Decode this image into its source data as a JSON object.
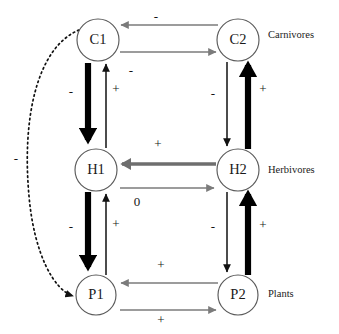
{
  "diagram": {
    "background_color": "#ffffff",
    "nodes": [
      {
        "id": "C1",
        "label": "C1",
        "cx": 98,
        "cy": 40,
        "r": 21
      },
      {
        "id": "C2",
        "label": "C2",
        "cx": 238,
        "cy": 40,
        "r": 21
      },
      {
        "id": "H1",
        "label": "H1",
        "cx": 96,
        "cy": 170,
        "r": 21
      },
      {
        "id": "H2",
        "label": "H2",
        "cx": 238,
        "cy": 170,
        "r": 21
      },
      {
        "id": "P1",
        "label": "P1",
        "cx": 96,
        "cy": 295,
        "r": 20
      },
      {
        "id": "P2",
        "label": "P2",
        "cx": 238,
        "cy": 295,
        "r": 20
      }
    ],
    "tier_labels": [
      {
        "text": "Carnivores",
        "x": 268,
        "y": 36
      },
      {
        "text": "Herbivores",
        "x": 268,
        "y": 171
      },
      {
        "text": "Plants",
        "x": 268,
        "y": 295
      }
    ],
    "edges": [
      {
        "name": "c2-to-c1",
        "from": "C2",
        "to": "C1",
        "style": "thin-gray",
        "sign": "-",
        "direction": "left"
      },
      {
        "name": "c1-to-c2",
        "from": "C1",
        "to": "C2",
        "style": "thin-gray",
        "sign": "-",
        "direction": "right"
      },
      {
        "name": "c1-to-h1",
        "from": "C1",
        "to": "H1",
        "style": "thick-dark",
        "sign": "-",
        "direction": "down"
      },
      {
        "name": "h1-to-c1",
        "from": "H1",
        "to": "C1",
        "style": "thin-dark",
        "sign": "+",
        "direction": "up"
      },
      {
        "name": "c2-to-h2",
        "from": "C2",
        "to": "H2",
        "style": "thin-dark",
        "sign": "-",
        "direction": "down"
      },
      {
        "name": "h2-to-c2",
        "from": "H2",
        "to": "C2",
        "style": "thick-dark",
        "sign": "+",
        "direction": "up"
      },
      {
        "name": "h2-to-h1",
        "from": "H2",
        "to": "H1",
        "style": "med-gray",
        "sign": "+",
        "direction": "left"
      },
      {
        "name": "h1-to-h2",
        "from": "H1",
        "to": "H2",
        "style": "thin-gray",
        "sign": "0",
        "direction": "right"
      },
      {
        "name": "h1-to-p1",
        "from": "H1",
        "to": "P1",
        "style": "thick-dark",
        "sign": "-",
        "direction": "down"
      },
      {
        "name": "p1-to-h1",
        "from": "P1",
        "to": "H1",
        "style": "thin-dark",
        "sign": "+",
        "direction": "up"
      },
      {
        "name": "h2-to-p2",
        "from": "H2",
        "to": "P2",
        "style": "thin-dark",
        "sign": "-",
        "direction": "down"
      },
      {
        "name": "p2-to-h2",
        "from": "P2",
        "to": "H2",
        "style": "thick-dark",
        "sign": "+",
        "direction": "up"
      },
      {
        "name": "p2-to-p1",
        "from": "P2",
        "to": "P1",
        "style": "thin-gray",
        "sign": "+",
        "direction": "left"
      },
      {
        "name": "p1-to-p2",
        "from": "P1",
        "to": "P2",
        "style": "thin-gray",
        "sign": "+",
        "direction": "right"
      },
      {
        "name": "c1-to-p1-dotted",
        "from": "C1",
        "to": "P1",
        "style": "dotted",
        "sign": "-",
        "direction": "curve-left"
      }
    ],
    "sign_labels": [
      {
        "name": "sign-c2-c1-top",
        "text": "-",
        "x": 156,
        "y": 18
      },
      {
        "name": "sign-c1-c2-bottom",
        "text": "-",
        "x": 131,
        "y": 72
      },
      {
        "name": "sign-h1-c1",
        "text": "+",
        "x": 116,
        "y": 90
      },
      {
        "name": "sign-c1-h1",
        "text": "-",
        "x": 71,
        "y": 93
      },
      {
        "name": "sign-c2-h2",
        "text": "-",
        "x": 213,
        "y": 95
      },
      {
        "name": "sign-h2-c2",
        "text": "+",
        "x": 263,
        "y": 90
      },
      {
        "name": "sign-h2-h1",
        "text": "+",
        "x": 158,
        "y": 145
      },
      {
        "name": "sign-h1-h2",
        "text": "0",
        "x": 137,
        "y": 203
      },
      {
        "name": "sign-h1-p1",
        "text": "-",
        "x": 71,
        "y": 228
      },
      {
        "name": "sign-p1-h1",
        "text": "+",
        "x": 116,
        "y": 225
      },
      {
        "name": "sign-h2-p2",
        "text": "-",
        "x": 213,
        "y": 228
      },
      {
        "name": "sign-p2-h2",
        "text": "+",
        "x": 263,
        "y": 226
      },
      {
        "name": "sign-p2-p1-top",
        "text": "+",
        "x": 161,
        "y": 266
      },
      {
        "name": "sign-p1-p2-bottom",
        "text": "+",
        "x": 161,
        "y": 321
      },
      {
        "name": "sign-c1-p1-dotted",
        "text": "-",
        "x": 16,
        "y": 160
      }
    ],
    "colors": {
      "gray_edge": "#7b7b7b",
      "dark_edge": "#000000",
      "node_stroke": "#5a5a5a",
      "text": "#1a1a1a"
    }
  }
}
